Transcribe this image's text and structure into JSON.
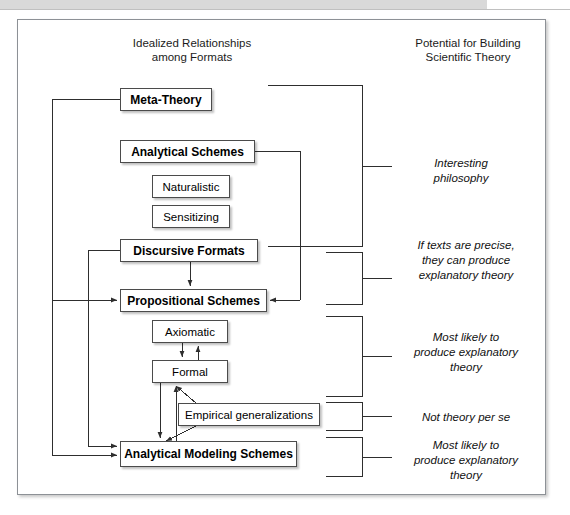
{
  "figure": {
    "headings": {
      "left": "Idealized Relationships\namong Formats",
      "right": "Potential for Building\nScientific Theory"
    },
    "nodes": [
      {
        "id": "meta-theory",
        "label": "Meta-Theory",
        "bold": true,
        "x": 120,
        "y": 88,
        "w": 92,
        "h": 23
      },
      {
        "id": "analytical-schemes",
        "label": "Analytical Schemes",
        "bold": true,
        "x": 120,
        "y": 140,
        "w": 135,
        "h": 23
      },
      {
        "id": "naturalistic",
        "label": "Naturalistic",
        "bold": false,
        "x": 152,
        "y": 175,
        "w": 78,
        "h": 23
      },
      {
        "id": "sensitizing",
        "label": "Sensitizing",
        "bold": false,
        "x": 152,
        "y": 205,
        "w": 78,
        "h": 23
      },
      {
        "id": "discursive-formats",
        "label": "Discursive Formats",
        "bold": true,
        "x": 120,
        "y": 239,
        "w": 138,
        "h": 23
      },
      {
        "id": "propositional-schemes",
        "label": "Propositional Schemes",
        "bold": true,
        "x": 120,
        "y": 289,
        "w": 147,
        "h": 23
      },
      {
        "id": "axiomatic",
        "label": "Axiomatic",
        "bold": false,
        "x": 152,
        "y": 320,
        "w": 76,
        "h": 23
      },
      {
        "id": "formal",
        "label": "Formal",
        "bold": false,
        "x": 152,
        "y": 360,
        "w": 76,
        "h": 23
      },
      {
        "id": "empirical-generalizations",
        "label": "Empirical generalizations",
        "bold": false,
        "x": 178,
        "y": 403,
        "w": 142,
        "h": 23
      },
      {
        "id": "analytical-modeling-schemes",
        "label": "Analytical Modeling Schemes",
        "bold": true,
        "x": 120,
        "y": 441,
        "w": 177,
        "h": 26
      }
    ],
    "notes": [
      {
        "id": "note-interesting-philosophy",
        "text": "Interesting\nphilosophy",
        "x": 386,
        "y": 156,
        "w": 150
      },
      {
        "id": "note-texts-precise",
        "text": "If texts are precise,\nthey can produce\nexplanatory theory",
        "x": 386,
        "y": 238,
        "w": 160
      },
      {
        "id": "note-most-likely-1",
        "text": "Most likely to\nproduce explanatory\ntheory",
        "x": 386,
        "y": 330,
        "w": 160
      },
      {
        "id": "note-not-theory",
        "text": "Not theory per se",
        "x": 386,
        "y": 410,
        "w": 160
      },
      {
        "id": "note-most-likely-2",
        "text": "Most likely to\nproduce explanatory\ntheory",
        "x": 386,
        "y": 438,
        "w": 160
      }
    ],
    "colors": {
      "frame_border": "#8d9196",
      "node_border": "#4b4b4b",
      "line": "#2e2e2e",
      "top_band": "#d9d9d9",
      "text": "#111111"
    }
  }
}
